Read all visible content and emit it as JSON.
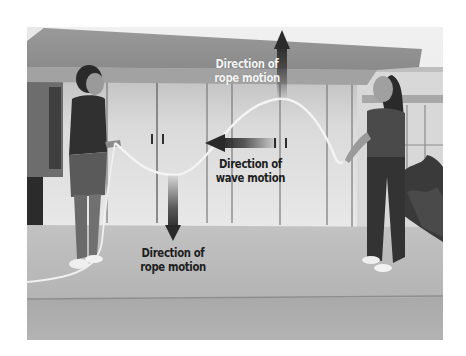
{
  "figure": {
    "type": "annotated-photograph",
    "colors": {
      "background": "#ffffff",
      "arrow_dark": "#2a2a2a",
      "label_light": "#f4f4f4",
      "label_dark": "#1e1e1e",
      "rope": "#f2f2f2"
    },
    "annotations": [
      {
        "id": "top-rope-motion",
        "line1": "Direction of",
        "line2": "rope motion",
        "arrow": "up-arrow"
      },
      {
        "id": "wave-motion",
        "line1": "Direction of",
        "line2": "wave motion",
        "arrow": "left-arrow"
      },
      {
        "id": "bottom-rope-motion",
        "line1": "Direction of",
        "line2": "rope motion",
        "arrow": "down-arrow"
      }
    ]
  }
}
